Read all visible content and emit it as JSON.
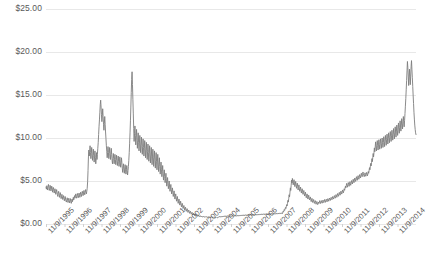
{
  "chart_data": {
    "type": "line",
    "title": "",
    "subtitle": "",
    "xlabel": "",
    "ylabel": "",
    "grid": true,
    "legend": false,
    "legend_position": "none",
    "line_color": "#7d7d7d",
    "gridline_color": "#e8e8e8",
    "background": "#ffffff",
    "ylim": [
      0,
      25
    ],
    "ytick_values": [
      25,
      20,
      15,
      10,
      5,
      0
    ],
    "ytick_labels": [
      "$25.00",
      "$20.00",
      "$15.00",
      "$10.00",
      "$5.00",
      "$0.00"
    ],
    "xtick_labels": [
      "11/9/1995",
      "11/9/1996",
      "11/9/1997",
      "11/9/1998",
      "11/9/1999",
      "11/9/2000",
      "11/9/2001",
      "11/9/2002",
      "11/9/2003",
      "11/9/2004",
      "11/9/2005",
      "11/9/2006",
      "11/9/2007",
      "11/9/2008",
      "11/9/2009",
      "11/9/2010",
      "11/9/2011",
      "11/9/2012",
      "11/9/2013",
      "11/9/2014"
    ],
    "xlim": [
      "11/9/1995",
      "11/9/2015"
    ],
    "series": [
      {
        "name": "price",
        "x_start": "11/9/1995",
        "x_end": "11/9/2015",
        "values": [
          4.3,
          4.05,
          4.45,
          4.2,
          3.95,
          4.35,
          4.6,
          4.25,
          3.9,
          4.15,
          4.5,
          4.3,
          3.85,
          4.05,
          4.4,
          4.2,
          3.7,
          3.95,
          4.25,
          4.0,
          3.6,
          3.85,
          4.1,
          3.8,
          3.45,
          3.7,
          4.0,
          3.75,
          3.4,
          3.2,
          3.55,
          3.8,
          3.5,
          3.1,
          3.35,
          3.65,
          3.3,
          2.95,
          3.15,
          3.45,
          3.2,
          2.85,
          3.05,
          3.3,
          3.0,
          2.7,
          2.95,
          3.2,
          2.9,
          2.65,
          2.55,
          2.8,
          3.05,
          2.75,
          2.5,
          2.75,
          3.0,
          2.7,
          2.45,
          2.7,
          2.95,
          2.65,
          2.4,
          2.65,
          2.9,
          2.6,
          2.85,
          3.1,
          2.8,
          3.05,
          3.3,
          3.0,
          3.25,
          3.5,
          3.2,
          3.0,
          3.25,
          3.55,
          3.3,
          3.05,
          3.3,
          3.6,
          3.35,
          3.1,
          3.4,
          3.7,
          3.45,
          3.2,
          3.5,
          3.8,
          3.55,
          3.3,
          3.6,
          3.9,
          3.65,
          3.4,
          3.7,
          4.0,
          3.75,
          3.5,
          3.8,
          4.15,
          4.9,
          6.2,
          7.8,
          8.6,
          7.9,
          8.4,
          9.1,
          8.3,
          7.6,
          8.2,
          8.9,
          8.1,
          7.4,
          8.0,
          8.7,
          7.95,
          7.2,
          7.8,
          8.5,
          7.7,
          7.0,
          7.6,
          8.3,
          7.5,
          8.1,
          8.8,
          9.5,
          10.4,
          11.3,
          12.1,
          13.0,
          13.9,
          14.4,
          13.6,
          12.7,
          11.9,
          12.6,
          13.4,
          12.5,
          11.6,
          10.9,
          11.7,
          12.5,
          11.6,
          10.7,
          9.9,
          9.1,
          8.4,
          7.7,
          8.3,
          9.0,
          8.3,
          7.6,
          8.2,
          8.9,
          8.2,
          7.5,
          8.1,
          8.8,
          8.1,
          7.4,
          7.0,
          7.6,
          8.2,
          7.6,
          7.0,
          7.5,
          8.1,
          7.5,
          6.9,
          7.4,
          8.0,
          7.4,
          6.8,
          7.3,
          7.9,
          7.3,
          6.7,
          7.2,
          7.8,
          7.2,
          6.6,
          7.1,
          7.7,
          7.1,
          6.5,
          6.0,
          6.5,
          7.0,
          6.4,
          5.9,
          6.4,
          6.9,
          6.3,
          5.8,
          6.3,
          6.8,
          6.2,
          5.7,
          6.2,
          6.7,
          7.4,
          8.3,
          9.4,
          10.6,
          12.0,
          13.6,
          15.3,
          16.8,
          17.7,
          16.2,
          14.5,
          12.8,
          11.1,
          9.6,
          10.5,
          11.4,
          10.3,
          9.2,
          10.1,
          11.0,
          9.9,
          8.8,
          9.7,
          10.6,
          9.5,
          8.5,
          9.4,
          10.3,
          9.3,
          8.3,
          9.2,
          10.1,
          9.1,
          8.1,
          9.0,
          9.9,
          8.9,
          7.9,
          8.8,
          9.7,
          8.7,
          7.7,
          8.6,
          9.5,
          8.5,
          7.5,
          8.4,
          9.3,
          8.3,
          7.3,
          8.2,
          9.1,
          8.1,
          7.1,
          8.0,
          8.9,
          7.9,
          6.9,
          7.8,
          8.7,
          7.7,
          6.7,
          7.6,
          8.5,
          7.5,
          6.5,
          7.4,
          8.3,
          7.3,
          6.3,
          7.2,
          8.1,
          7.1,
          6.1,
          6.9,
          7.7,
          6.7,
          5.8,
          6.5,
          7.2,
          6.3,
          5.5,
          6.1,
          6.8,
          5.9,
          5.1,
          5.7,
          6.3,
          5.5,
          4.8,
          5.3,
          5.9,
          5.1,
          4.4,
          4.9,
          5.4,
          4.7,
          4.1,
          4.5,
          5.0,
          4.3,
          3.8,
          4.2,
          4.6,
          4.0,
          3.5,
          3.85,
          4.2,
          3.65,
          3.2,
          3.5,
          3.85,
          3.35,
          2.9,
          3.2,
          3.5,
          3.05,
          2.65,
          2.9,
          3.2,
          2.8,
          2.4,
          2.65,
          2.9,
          2.55,
          2.2,
          2.4,
          2.65,
          2.3,
          2.0,
          2.2,
          2.4,
          2.1,
          1.8,
          1.98,
          2.15,
          1.88,
          1.62,
          1.78,
          1.95,
          1.7,
          1.48,
          1.62,
          1.78,
          1.55,
          1.35,
          1.48,
          1.62,
          1.42,
          1.24,
          1.36,
          1.48,
          1.3,
          1.14,
          1.24,
          1.36,
          1.2,
          1.05,
          1.15,
          1.25,
          1.1,
          0.98,
          1.06,
          1.16,
          1.02,
          0.92,
          0.99,
          1.08,
          0.96,
          0.88,
          0.94,
          1.02,
          0.92,
          0.85,
          0.9,
          0.97,
          0.88,
          0.82,
          0.87,
          0.93,
          0.86,
          0.8,
          0.84,
          0.9,
          0.83,
          0.78,
          0.82,
          0.88,
          0.82,
          0.77,
          0.81,
          0.86,
          0.8,
          0.76,
          0.8,
          0.85,
          0.79,
          0.75,
          0.79,
          0.84,
          0.78,
          0.74,
          0.78,
          0.83,
          0.77,
          0.73,
          0.77,
          0.82,
          0.77,
          0.73,
          0.77,
          0.82,
          0.76,
          0.72,
          0.76,
          0.81,
          0.76,
          0.72,
          0.76,
          0.81,
          0.78,
          0.84,
          0.9,
          0.84,
          0.79,
          0.85,
          0.91,
          0.85,
          0.8,
          0.86,
          0.93,
          0.87,
          0.82,
          0.88,
          0.95,
          0.89,
          0.83,
          0.89,
          0.96,
          0.9,
          0.84,
          0.9,
          0.97,
          0.91,
          0.85,
          0.91,
          0.98,
          0.92,
          0.86,
          0.92,
          0.99,
          0.93,
          0.87,
          0.93,
          1.0,
          0.94,
          0.88,
          0.94,
          1.01,
          0.95,
          0.89,
          0.95,
          1.02,
          0.96,
          0.9,
          0.96,
          1.03,
          0.97,
          0.91,
          0.97,
          1.04,
          0.98,
          0.92,
          0.98,
          1.05,
          0.99,
          0.93,
          0.99,
          1.06,
          1.0,
          0.94,
          1.0,
          1.07,
          1.01,
          0.95,
          1.01,
          1.08,
          1.02,
          0.96,
          1.02,
          1.09,
          1.03,
          0.97,
          1.03,
          1.1,
          1.04,
          0.98,
          1.04,
          1.11,
          1.05,
          0.99,
          1.05,
          1.12,
          1.06,
          1.0,
          1.06,
          1.13,
          1.07,
          1.01,
          1.07,
          1.14,
          1.08,
          1.02,
          1.08,
          1.15,
          1.09,
          1.03,
          1.09,
          1.16,
          1.1,
          1.04,
          1.1,
          1.17,
          1.11,
          1.05,
          1.11,
          1.18,
          1.12,
          1.06,
          1.12,
          1.19,
          1.13,
          1.07,
          1.13,
          1.2,
          1.14,
          1.08,
          1.14,
          1.21,
          1.15,
          1.09,
          1.15,
          1.22,
          1.16,
          1.1,
          1.16,
          1.23,
          1.17,
          1.11,
          1.17,
          1.24,
          1.18,
          1.12,
          1.18,
          1.25,
          1.19,
          1.13,
          1.19,
          1.26,
          1.2,
          1.14,
          1.2,
          1.27,
          1.21,
          1.15,
          1.21,
          1.28,
          1.22,
          1.16,
          1.22,
          1.29,
          1.23,
          1.17,
          1.23,
          1.3,
          1.24,
          1.18,
          1.3,
          1.45,
          1.38,
          1.52,
          1.68,
          1.58,
          1.75,
          1.92,
          1.8,
          2.0,
          2.25,
          2.1,
          2.4,
          2.75,
          2.55,
          2.95,
          3.4,
          3.15,
          3.65,
          4.2,
          3.9,
          4.5,
          5.1,
          4.75,
          5.3,
          4.95,
          4.55,
          4.85,
          5.15,
          4.75,
          4.35,
          4.65,
          4.95,
          4.55,
          4.15,
          4.45,
          4.75,
          4.35,
          3.95,
          4.25,
          4.55,
          4.15,
          3.8,
          4.05,
          4.3,
          3.95,
          3.6,
          3.85,
          4.1,
          3.75,
          3.45,
          3.65,
          3.9,
          3.55,
          3.25,
          3.45,
          3.7,
          3.35,
          3.05,
          3.25,
          3.5,
          3.2,
          2.9,
          3.1,
          3.35,
          3.05,
          2.8,
          2.95,
          3.15,
          2.85,
          2.6,
          2.78,
          2.98,
          2.72,
          2.5,
          2.66,
          2.85,
          2.6,
          2.4,
          2.55,
          2.72,
          2.5,
          2.3,
          2.46,
          2.62,
          2.42,
          2.25,
          2.4,
          2.55,
          2.38,
          2.55,
          2.72,
          2.55,
          2.38,
          2.55,
          2.72,
          2.56,
          2.42,
          2.6,
          2.78,
          2.62,
          2.48,
          2.66,
          2.85,
          2.68,
          2.52,
          2.7,
          2.88,
          2.72,
          2.58,
          2.76,
          2.95,
          2.8,
          2.65,
          2.84,
          3.02,
          2.88,
          2.74,
          2.92,
          3.1,
          2.95,
          2.82,
          3.0,
          3.2,
          3.05,
          2.9,
          3.1,
          3.3,
          3.15,
          3.0,
          3.2,
          3.42,
          3.25,
          3.1,
          3.32,
          3.55,
          3.38,
          3.22,
          3.45,
          3.68,
          3.5,
          3.35,
          3.58,
          3.82,
          3.65,
          3.48,
          3.72,
          3.96,
          3.78,
          3.62,
          3.86,
          4.1,
          3.92,
          4.15,
          4.4,
          4.2,
          4.45,
          4.72,
          4.5,
          4.28,
          4.55,
          4.82,
          4.6,
          4.38,
          4.65,
          4.92,
          4.7,
          4.5,
          4.78,
          5.05,
          4.85,
          4.65,
          4.92,
          5.2,
          5.0,
          4.8,
          5.08,
          5.35,
          5.15,
          4.95,
          5.22,
          5.5,
          5.28,
          5.08,
          5.35,
          5.62,
          5.4,
          5.2,
          5.48,
          5.75,
          5.55,
          5.35,
          5.62,
          5.9,
          5.7,
          5.5,
          5.78,
          6.05,
          5.85,
          5.65,
          5.5,
          5.72,
          5.95,
          5.75,
          5.55,
          5.78,
          6.0,
          5.8,
          5.6,
          5.82,
          6.1,
          5.9,
          6.2,
          6.55,
          6.3,
          6.65,
          7.05,
          6.75,
          7.15,
          7.6,
          7.25,
          7.7,
          8.2,
          7.8,
          8.3,
          8.85,
          8.4,
          8.95,
          9.55,
          9.05,
          8.5,
          9.1,
          9.7,
          9.15,
          8.6,
          9.2,
          9.8,
          9.25,
          8.7,
          9.3,
          9.9,
          9.35,
          8.8,
          9.4,
          10.0,
          9.45,
          8.9,
          9.5,
          10.15,
          9.6,
          9.0,
          9.65,
          10.3,
          9.75,
          9.15,
          9.8,
          10.45,
          9.9,
          9.3,
          9.95,
          10.6,
          10.05,
          9.45,
          10.1,
          10.75,
          10.2,
          9.6,
          10.25,
          10.9,
          10.35,
          9.75,
          10.4,
          11.1,
          10.5,
          9.9,
          10.6,
          11.3,
          10.7,
          10.1,
          10.8,
          11.5,
          10.9,
          10.3,
          11.0,
          11.75,
          11.15,
          10.55,
          11.25,
          12.0,
          11.4,
          10.8,
          11.5,
          12.25,
          11.65,
          11.05,
          11.75,
          12.5,
          11.9,
          11.3,
          12.05,
          12.85,
          13.7,
          14.6,
          15.6,
          16.7,
          17.8,
          18.9,
          18.2,
          17.2,
          16.1,
          17.0,
          18.0,
          17.1,
          16.2,
          17.2,
          18.3,
          19.0,
          18.0,
          17.0,
          16.0,
          15.0,
          14.0,
          13.0,
          12.2,
          11.5,
          11.0,
          10.6,
          10.4
        ]
      }
    ]
  },
  "plot_area": {
    "left": 46,
    "right": 416,
    "top": 9,
    "bottom": 224
  }
}
